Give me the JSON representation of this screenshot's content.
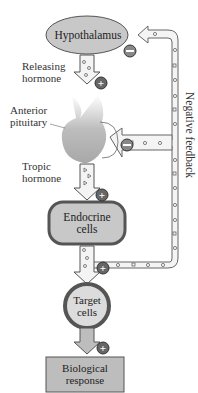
{
  "title_fragment": "",
  "nodes": {
    "hypothalamus": "Hypothalamus",
    "anterior_pituitary": [
      "Anterior",
      "pituitary"
    ],
    "endocrine_cells": [
      "Endocrine",
      "cells"
    ],
    "target_cells": [
      "Target",
      "cells"
    ],
    "biological_response": [
      "Biological",
      "response"
    ]
  },
  "edges": {
    "releasing_hormone": [
      "Releasing",
      "hormone"
    ],
    "tropic_hormone": [
      "Tropic",
      "hormone"
    ],
    "negative_feedback": "Negative feedback"
  },
  "signs": {
    "positive": "+",
    "negative": "−"
  },
  "colors": {
    "node_fill": "#c8c8c8",
    "node_stroke": "#555555",
    "arrow_fill": "#f4f4f4",
    "sign_fill": "#666666"
  }
}
